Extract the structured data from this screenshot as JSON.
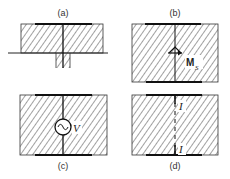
{
  "figure": {
    "panels": [
      {
        "id": "a",
        "label": "(a)",
        "description": "Crystal slab on ground plane with top electrode and protruding lower stub"
      },
      {
        "id": "b",
        "label": "(b)",
        "description": "Crystal slab between electrodes with surface magnetization vector",
        "symbol": "M",
        "subscript": "S"
      },
      {
        "id": "c",
        "label": "(c)",
        "description": "Crystal slab between electrodes with AC voltage source",
        "symbol": "V",
        "source_glyph": "~"
      },
      {
        "id": "d",
        "label": "(d)",
        "description": "Crystal slab between electrodes with current path",
        "symbol_top": "I",
        "symbol_bottom": "I"
      }
    ],
    "colors": {
      "stroke": "#222222",
      "hatch": "#444444",
      "background": "#ffffff"
    }
  }
}
